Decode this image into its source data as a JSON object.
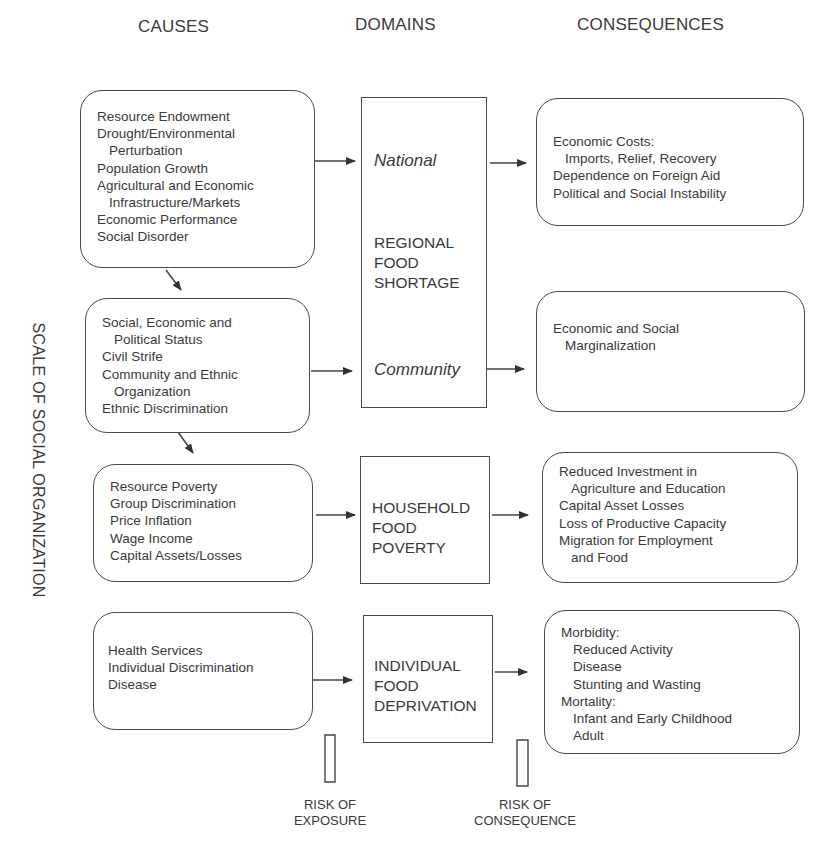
{
  "headers": {
    "causes": "CAUSES",
    "domains": "DOMAINS",
    "consequences": "CONSEQUENCES"
  },
  "vertical_axis_label": "SCALE OF SOCIAL ORGANIZATION",
  "causes": [
    {
      "lines": [
        {
          "text": "Resource Endowment",
          "indent": false
        },
        {
          "text": "Drought/Environmental",
          "indent": false
        },
        {
          "text": "Perturbation",
          "indent": true
        },
        {
          "text": "Population Growth",
          "indent": false
        },
        {
          "text": "Agricultural and Economic",
          "indent": false
        },
        {
          "text": "Infrastructure/Markets",
          "indent": true
        },
        {
          "text": "Economic Performance",
          "indent": false
        },
        {
          "text": "Social Disorder",
          "indent": false
        }
      ]
    },
    {
      "lines": [
        {
          "text": "Social, Economic and",
          "indent": false
        },
        {
          "text": "Political Status",
          "indent": true
        },
        {
          "text": "Civil Strife",
          "indent": false
        },
        {
          "text": "Community and Ethnic",
          "indent": false
        },
        {
          "text": "Organization",
          "indent": true
        },
        {
          "text": "Ethnic Discrimination",
          "indent": false
        }
      ]
    },
    {
      "lines": [
        {
          "text": "Resource Poverty",
          "indent": false
        },
        {
          "text": "Group Discrimination",
          "indent": false
        },
        {
          "text": "Price Inflation",
          "indent": false
        },
        {
          "text": "Wage Income",
          "indent": false
        },
        {
          "text": "Capital Assets/Losses",
          "indent": false
        }
      ]
    },
    {
      "lines": [
        {
          "text": "Health Services",
          "indent": false
        },
        {
          "text": "Individual Discrimination",
          "indent": false
        },
        {
          "text": "Disease",
          "indent": false
        }
      ]
    }
  ],
  "domains": {
    "regional": {
      "national": "National",
      "title_lines": [
        "REGIONAL",
        "FOOD",
        "SHORTAGE"
      ],
      "community": "Community"
    },
    "household": {
      "title_lines": [
        "HOUSEHOLD",
        "FOOD",
        "POVERTY"
      ]
    },
    "individual": {
      "title_lines": [
        "INDIVIDUAL",
        "FOOD",
        "DEPRIVATION"
      ]
    }
  },
  "consequences": [
    {
      "lines": [
        {
          "text": "Economic Costs:",
          "indent": false
        },
        {
          "text": "Imports, Relief, Recovery",
          "indent": true
        },
        {
          "text": "Dependence on Foreign Aid",
          "indent": false
        },
        {
          "text": "Political and Social Instability",
          "indent": false
        }
      ]
    },
    {
      "lines": [
        {
          "text": "Economic and Social",
          "indent": false
        },
        {
          "text": "Marginalization",
          "indent": true
        }
      ]
    },
    {
      "lines": [
        {
          "text": "Reduced Investment in",
          "indent": false
        },
        {
          "text": "Agriculture and Education",
          "indent": true
        },
        {
          "text": "Capital Asset Losses",
          "indent": false
        },
        {
          "text": "Loss of Productive Capacity",
          "indent": false
        },
        {
          "text": "Migration for Employment",
          "indent": false
        },
        {
          "text": "and Food",
          "indent": true
        }
      ]
    },
    {
      "lines": [
        {
          "text": "Morbidity:",
          "indent": false
        },
        {
          "text": "Reduced Activity",
          "indent": true
        },
        {
          "text": "Disease",
          "indent": true
        },
        {
          "text": "Stunting and Wasting",
          "indent": true
        },
        {
          "text": "Mortality:",
          "indent": false
        },
        {
          "text": "Infant and Early Childhood",
          "indent": true
        },
        {
          "text": "Adult",
          "indent": true
        }
      ]
    }
  ],
  "risk_labels": {
    "exposure": [
      "RISK OF",
      "EXPOSURE"
    ],
    "consequence": [
      "RISK OF",
      "CONSEQUENCE"
    ]
  },
  "colors": {
    "stroke": "#4a4a4a",
    "text": "#3a3a3a",
    "background": "#ffffff"
  }
}
